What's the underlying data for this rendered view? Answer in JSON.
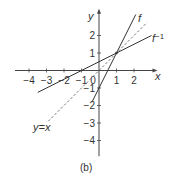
{
  "chart_data": {
    "type": "line",
    "title": "",
    "caption": "(b)",
    "xlabel": "x",
    "ylabel": "y",
    "xlim": [
      -4.8,
      3.0
    ],
    "ylim": [
      -4.9,
      3.3
    ],
    "x_ticks": [
      -4,
      -3,
      -2,
      -1,
      0,
      1,
      2
    ],
    "x_tick_labels": [
      "−4",
      "−3",
      "−2",
      "−1",
      "0",
      "1",
      "2"
    ],
    "y_ticks": [
      -4,
      -3,
      -2,
      -1,
      1,
      2
    ],
    "y_tick_labels": [
      "−4",
      "−3",
      "−2",
      "−1",
      "1",
      "2"
    ],
    "grid": false,
    "series": [
      {
        "name": "f",
        "label": "f",
        "style": "solid",
        "equation": "y = 2x - 1",
        "x": [
          -0.4,
          2.1
        ],
        "y": [
          -1.8,
          3.2
        ]
      },
      {
        "name": "f_inverse",
        "label": "f−1",
        "style": "solid",
        "equation": "y = (x + 1)/2",
        "x": [
          -3.5,
          3.0
        ],
        "y": [
          -1.25,
          2.0
        ]
      },
      {
        "name": "identity",
        "label": "y=x",
        "style": "dashed",
        "equation": "y = x",
        "x": [
          -2.9,
          2.75
        ],
        "y": [
          -2.9,
          2.75
        ]
      }
    ],
    "annotations": [
      {
        "text": "intersection point",
        "x": 1,
        "y": 1
      }
    ]
  }
}
